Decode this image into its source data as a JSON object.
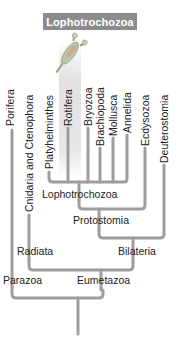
{
  "header": {
    "title": "Lophotrochozoa",
    "background": "#8c8c8c",
    "text_color": "#ffffff"
  },
  "illustration": {
    "icon": "rotifer-icon",
    "highlighted_taxon": "Rotifera"
  },
  "taxa": [
    {
      "label": "Porifera"
    },
    {
      "label": "Cnidaria and Ctenophora"
    },
    {
      "label": "Platyhelminthes"
    },
    {
      "label": "Rotifera"
    },
    {
      "label": "Bryozoa"
    },
    {
      "label": "Brachiopoda"
    },
    {
      "label": "Mollusca"
    },
    {
      "label": "Annelida"
    },
    {
      "label": "Ecdysozoa"
    },
    {
      "label": "Deuterostomia"
    }
  ],
  "clades": {
    "lophotrochozoa": "Lophotrochozoa",
    "protostomia": "Protostomia",
    "radiata": "Radiata",
    "bilateria": "Bilateria",
    "parazoa": "Parazoa",
    "eumetazoa": "Eumetazoa"
  },
  "colors": {
    "branch": "#9e9e9e",
    "highlight": "#dcdcdc"
  }
}
